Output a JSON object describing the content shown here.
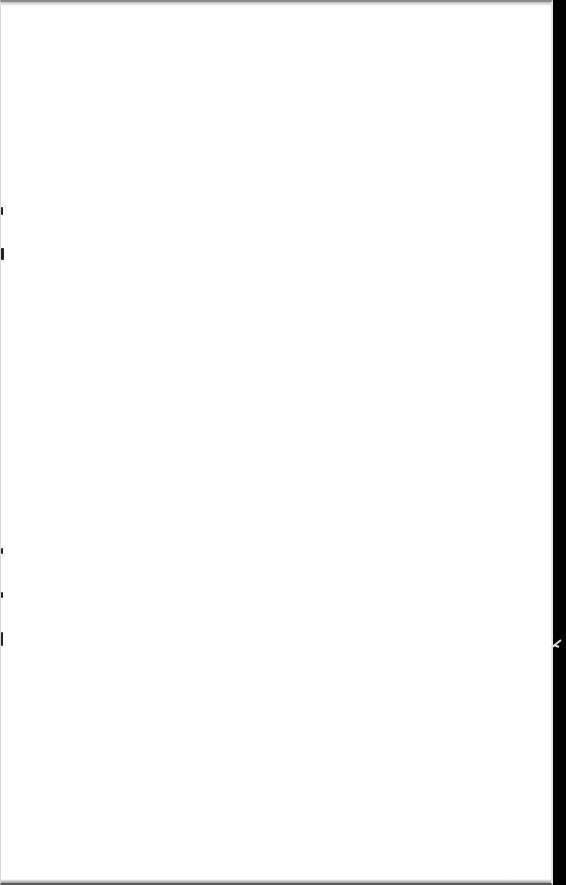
{
  "document": {
    "type": "scanned-page",
    "content": "",
    "page_color": "#ffffff",
    "scanner_background_color": "#000000"
  }
}
